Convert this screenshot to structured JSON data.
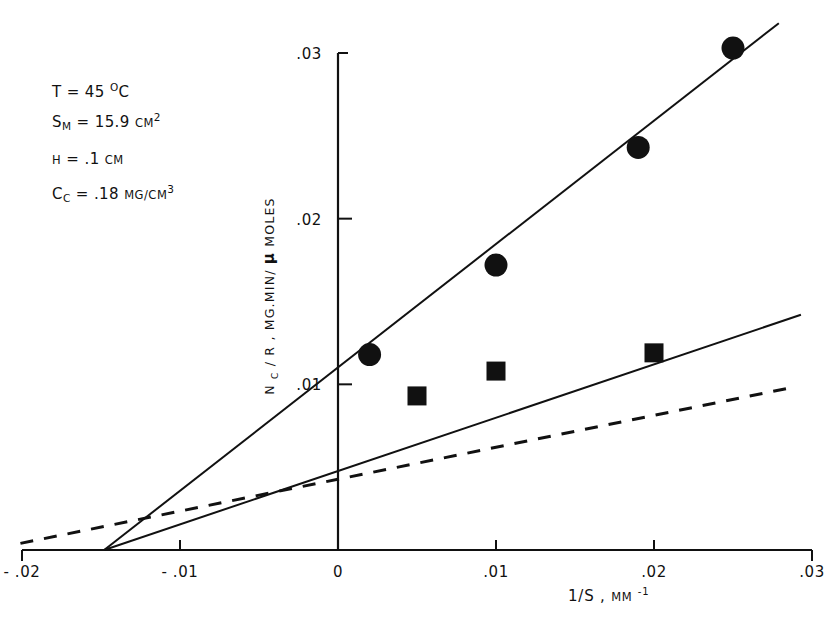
{
  "chart_data": {
    "type": "scatter",
    "title": "",
    "xlabel": "1/S , MM⁻¹",
    "xlabel_parts": {
      "main": "1/S ,",
      "unit": "MM",
      "exponent": "-1"
    },
    "ylabel": "N_C / R , MG.MIN/μMOLES",
    "ylabel_parts": {
      "lead": "N",
      "lead_sub": "C",
      "mid": " / R , MG.MIN/",
      "mu": "μ",
      "tail": "MOLES"
    },
    "xlim": [
      -0.02,
      0.03
    ],
    "ylim": [
      0,
      0.0325
    ],
    "grid": false,
    "legend": "none",
    "xticks": [
      -0.02,
      -0.01,
      0,
      0.01,
      0.02,
      0.03
    ],
    "xtick_labels": [
      "- .02",
      "- .01",
      "0",
      ".01",
      ".02",
      ".03"
    ],
    "yticks": [
      0.01,
      0.02,
      0.03
    ],
    "ytick_labels": [
      ".01",
      ".02",
      ".03"
    ],
    "series": [
      {
        "name": "upper-circles",
        "marker": "circle",
        "color": "#111111",
        "points": [
          {
            "x": 0.002,
            "y": 0.0118
          },
          {
            "x": 0.01,
            "y": 0.0172
          },
          {
            "x": 0.019,
            "y": 0.0243
          },
          {
            "x": 0.025,
            "y": 0.0303
          }
        ]
      },
      {
        "name": "lower-squares",
        "marker": "square",
        "color": "#111111",
        "points": [
          {
            "x": 0.005,
            "y": 0.0093
          },
          {
            "x": 0.01,
            "y": 0.0108
          },
          {
            "x": 0.02,
            "y": 0.0119
          }
        ]
      }
    ],
    "fit_lines": [
      {
        "name": "upper-fit",
        "style": "solid",
        "x_intercept": -0.0148,
        "from": {
          "x": -0.0148,
          "y": 0.0
        },
        "to": {
          "x": 0.0279,
          "y": 0.0318
        }
      },
      {
        "name": "lower-fit",
        "style": "solid",
        "x_intercept": -0.0148,
        "from": {
          "x": -0.0148,
          "y": 0.0
        },
        "to": {
          "x": 0.0293,
          "y": 0.0142
        }
      },
      {
        "name": "reference-dashed",
        "style": "dashed",
        "from": {
          "x": -0.0201,
          "y": 0.0004
        },
        "to": {
          "x": 0.0287,
          "y": 0.0098
        }
      }
    ]
  },
  "annotations": {
    "lines": [
      {
        "label": "T",
        "sub": "",
        "value": "= 45",
        "unit": "°C",
        "sup": ""
      },
      {
        "label": "S",
        "sub": "M",
        "value": "= 15.9",
        "unit": "CM",
        "sup": "2"
      },
      {
        "label": "H",
        "sub": "",
        "value": "= .1",
        "unit": "CM",
        "sup": ""
      },
      {
        "label": "C",
        "sub": "C",
        "value": "= .18",
        "unit": "MG/CM",
        "sup": "3"
      }
    ],
    "temperature": "T = 45 °C",
    "surface_area": "S_M = 15.9 CM2",
    "height": "H = .1 CM",
    "concentration": "C_C = .18 MG/CM3"
  },
  "colors": {
    "ink": "#111111",
    "background": "#ffffff"
  }
}
